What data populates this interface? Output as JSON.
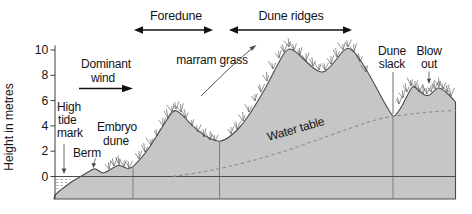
{
  "figure": {
    "axis": {
      "title": "Height in metres",
      "ticks": [
        "10",
        "8",
        "6",
        "4",
        "2",
        "0"
      ]
    },
    "zones": {
      "foredune": "Foredune",
      "dune_ridges": "Dune ridges"
    },
    "labels": {
      "dominant_wind_line1": "Dominant",
      "dominant_wind_line2": "wind",
      "high_tide_line1": "High",
      "high_tide_line2": "tide",
      "high_tide_line3": "mark",
      "berm": "Berm",
      "embryo_dune_line1": "Embryo",
      "embryo_dune_line2": "dune",
      "marram_grass": "marram grass",
      "water_table": "Water table",
      "dune_slack_line1": "Dune",
      "dune_slack_line2": "slack",
      "blow_out_line1": "Blow",
      "blow_out_line2": "out"
    },
    "colors": {
      "sand": "#c6c6c6",
      "outline": "#4a4a4a",
      "text": "#141414",
      "water_table_dash": "#8f8f8f"
    }
  }
}
